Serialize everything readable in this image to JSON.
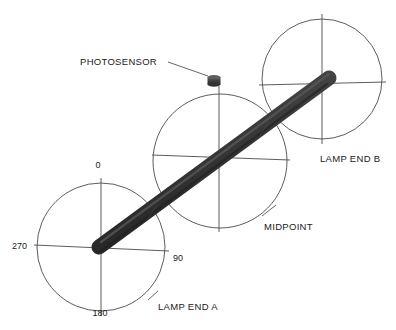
{
  "diagram": {
    "background_color": "#ffffff",
    "line_color": "#4a4a4a",
    "rod_color": "#3b3b3b",
    "rod_highlight_color": "#5a5a5a",
    "rod_shadow_color": "#262626",
    "sensor_color": "#404040",
    "labels": {
      "photosensor": "PHOTOSENSOR",
      "lamp_end_a": "LAMP END A",
      "lamp_end_b": "LAMP END B",
      "midpoint": "MIDPOINT"
    },
    "angle_ticks": {
      "top": "0",
      "right": "90",
      "bottom": "180",
      "left": "270"
    },
    "circles": [
      {
        "name": "lamp-end-a",
        "cx": 101,
        "cy": 247,
        "r": 64
      },
      {
        "name": "midpoint",
        "cx": 220,
        "cy": 161,
        "r": 67
      },
      {
        "name": "lamp-end-b",
        "cx": 322,
        "cy": 79,
        "r": 60
      }
    ],
    "rod": {
      "x1": 98,
      "y1": 247,
      "x2": 330,
      "y2": 78,
      "width": 14
    },
    "sensor": {
      "cx": 214,
      "cy": 81,
      "width": 13,
      "height": 9
    }
  }
}
